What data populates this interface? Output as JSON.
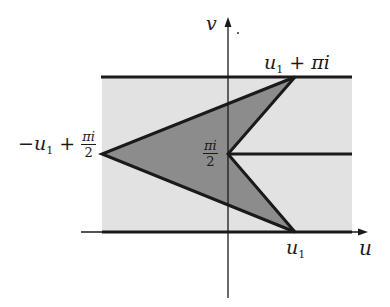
{
  "diagram": {
    "type": "complex-plane-region",
    "axes": {
      "horizontal_label": "u",
      "vertical_label": "v"
    },
    "strip": {
      "description": "horizontal strip between v = 0 and v = π",
      "fill_color": "#e2e2e2",
      "boundary_color": "#1a1a1a"
    },
    "polygon": {
      "description": "arrow-shaped quadrilateral region",
      "fill_color": "#8c8c8c",
      "vertices": [
        "u1 + πi",
        "-u1 + πi/2",
        "u1",
        "πi/2"
      ]
    },
    "slit": {
      "description": "horizontal slit from πi/2 to the right"
    },
    "labels": {
      "top_right": {
        "var": "u",
        "sub": "1",
        "rest": " + πi"
      },
      "left": {
        "prefix": "−",
        "var": "u",
        "sub": "1",
        "plus": " + ",
        "frac_num": "πi",
        "frac_den": "2"
      },
      "center": {
        "frac_num": "πi",
        "frac_den": "2"
      },
      "bottom": {
        "var": "u",
        "sub": "1"
      },
      "u_axis": "u",
      "v_axis": "v"
    }
  }
}
